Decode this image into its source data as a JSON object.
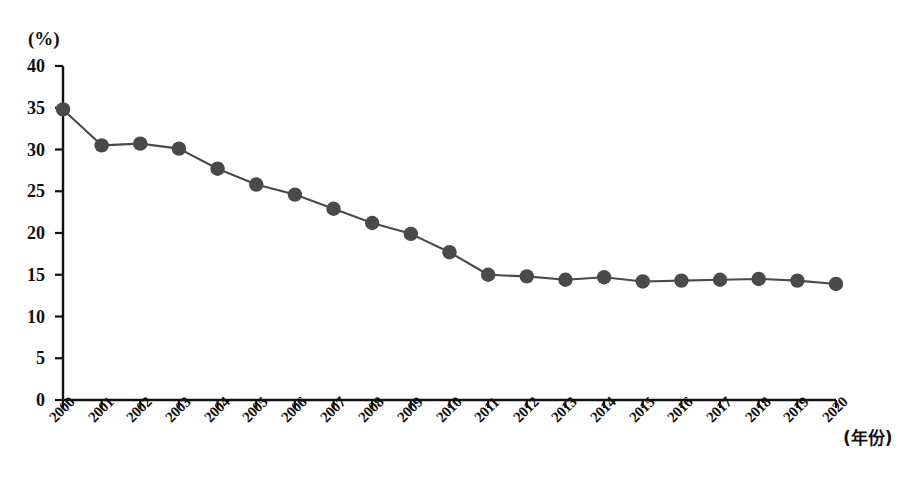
{
  "chart_data": {
    "type": "line",
    "title": "",
    "xlabel": "(年份)",
    "ylabel": "(%)",
    "categories": [
      "2000",
      "2001",
      "2002",
      "2003",
      "2004",
      "2005",
      "2006",
      "2007",
      "2008",
      "2009",
      "2010",
      "2011",
      "2012",
      "2013",
      "2014",
      "2015",
      "2016",
      "2017",
      "2018",
      "2019",
      "2020"
    ],
    "values": [
      34.8,
      30.5,
      30.7,
      30.1,
      27.7,
      25.8,
      24.6,
      22.9,
      21.2,
      19.9,
      17.7,
      15.0,
      14.8,
      14.4,
      14.7,
      14.2,
      14.3,
      14.4,
      14.5,
      14.3,
      13.9
    ],
    "series": [
      {
        "name": "",
        "values": [
          34.8,
          30.5,
          30.7,
          30.1,
          27.7,
          25.8,
          24.6,
          22.9,
          21.2,
          19.9,
          17.7,
          15.0,
          14.8,
          14.4,
          14.7,
          14.2,
          14.3,
          14.4,
          14.5,
          14.3,
          13.9
        ]
      }
    ],
    "ylim": [
      0,
      40
    ],
    "yticks": [
      0,
      5,
      10,
      15,
      20,
      25,
      30,
      35,
      40
    ],
    "ytick_labels": [
      "0",
      "5",
      "10",
      "15",
      "20",
      "25",
      "30",
      "35",
      "40"
    ],
    "grid": false,
    "legend": "none",
    "marker": "circle",
    "colors": {
      "line": "#4a4a4a",
      "marker": "#4a4a4a",
      "axis": "#111111",
      "background": "#ffffff"
    }
  },
  "axes": {
    "unit_label": "(%)",
    "x_axis_title": "(年份)"
  }
}
